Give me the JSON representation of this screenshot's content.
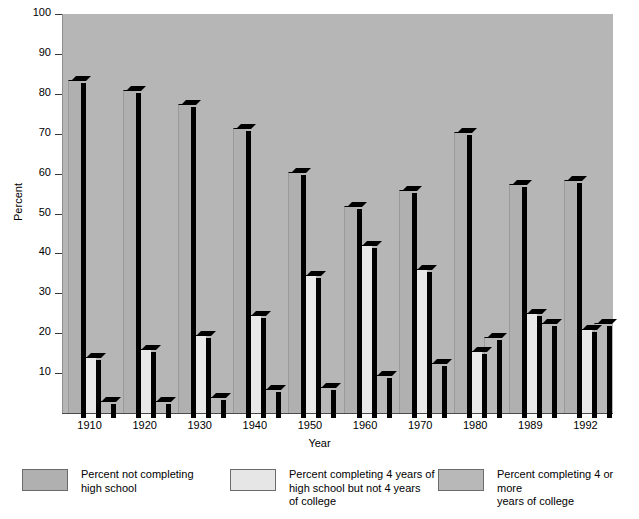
{
  "chart_data": {
    "type": "bar",
    "title": "",
    "xlabel": "Year",
    "ylabel": "Percent",
    "ylim": [
      0,
      100
    ],
    "yticks": [
      10,
      20,
      30,
      40,
      50,
      60,
      70,
      80,
      90,
      100
    ],
    "grid": false,
    "legend_position": "bottom",
    "categories": [
      "1910",
      "1920",
      "1930",
      "1940",
      "1950",
      "1960",
      "1970",
      "1980",
      "1989",
      "1992"
    ],
    "series": [
      {
        "name": "Percent not completing\nhigh school",
        "color": "#b0b0b0",
        "values": [
          83.5,
          81,
          77.5,
          71.5,
          60.5,
          52,
          56,
          70.5,
          57.5,
          58.5
        ]
      },
      {
        "name": "Percent completing 4 years of\nhigh school but not 4 years\nof college",
        "color": "#e8e8e8",
        "values": [
          14,
          16,
          19.5,
          24.5,
          34.5,
          42,
          36,
          15.5,
          25,
          21
        ]
      },
      {
        "name": "Percent completing 4 or more\nyears of college",
        "color": "#b8b8b8",
        "values": [
          3,
          3,
          4,
          6,
          6.5,
          9.5,
          12.5,
          19,
          22.5,
          22.5
        ]
      }
    ]
  },
  "axes": {
    "y_title": "Percent",
    "x_title": "Year",
    "y_tick_labels": [
      "100",
      "90",
      "80",
      "70",
      "60",
      "50",
      "40",
      "30",
      "20",
      "10"
    ],
    "x_tick_labels": [
      "1910",
      "1920",
      "1930",
      "1940",
      "1950",
      "1960",
      "1970",
      "1980",
      "1989",
      "1992"
    ]
  },
  "legend": {
    "items": [
      {
        "label": "Percent not completing\nhigh school",
        "swatch": "s1"
      },
      {
        "label": "Percent completing 4 years of\nhigh school but not 4 years\nof college",
        "swatch": "s2"
      },
      {
        "label": "Percent completing 4 or more\nyears of college",
        "swatch": "s3"
      }
    ]
  },
  "colors": {
    "plot_background": "#b6b6b6",
    "series1": "#b0b0b0",
    "series2": "#e8e8e8",
    "series3": "#b8b8b8",
    "shadow": "#000000",
    "page_background": "#ffffff"
  }
}
